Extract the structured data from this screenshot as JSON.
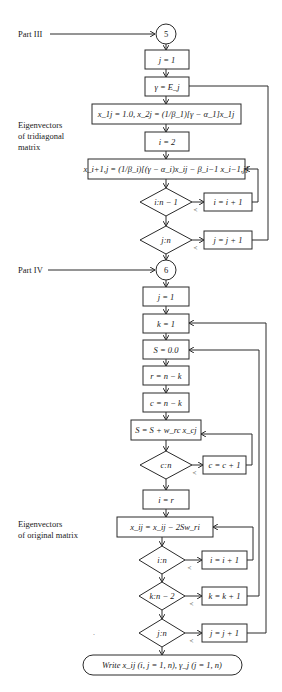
{
  "labels": {
    "part3": "Part III",
    "part4": "Part IV",
    "tridiag_1": "Eigenvectors",
    "tridiag_2": "of tridiagonal",
    "tridiag_3": "matrix",
    "orig_1": "Eigenvectors",
    "orig_2": "of original matrix"
  },
  "connectors": {
    "c5": "5",
    "c6": "6"
  },
  "part3": {
    "j_init": "j = 1",
    "gamma": "γ = E_j",
    "x_init": "x_1j = 1.0,  x_2j = (1/β_1)[γ − α_1]x_1j",
    "i_init": "i = 2",
    "x_recur": "x_i+1,j = (1/β_i)[(γ − α_i)x_ij − β_i−1 x_i−1,j]",
    "test_i": "i:n − 1",
    "inc_i": "i = i + 1",
    "test_j": "j:n",
    "inc_j": "j = j + 1"
  },
  "part4": {
    "j_init": "j = 1",
    "k_init": "k = 1",
    "s_init": "S = 0.0",
    "r_assign": "r = n − k",
    "c_assign": "c = n − k",
    "s_accum": "S = S + w_rc x_cj",
    "test_c": "c:n",
    "inc_c": "c = c + 1",
    "i_assign": "i = r",
    "x_update": "x_ij = x_ij − 2Sw_ri",
    "test_i": "i:n",
    "inc_i": "i = i + 1",
    "test_k": "k:n − 2",
    "inc_k": "k = k + 1",
    "test_j": "j:n",
    "inc_j": "j = j + 1"
  },
  "less_than": "<",
  "terminal": "Write x_ij (i, j = 1, n), γ_j (j = 1, n)"
}
